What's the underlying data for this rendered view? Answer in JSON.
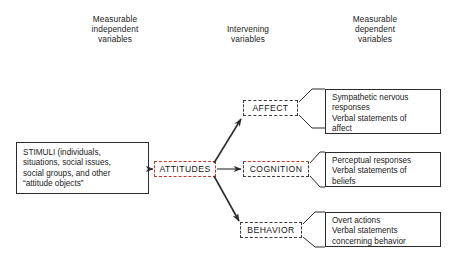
{
  "figure": {
    "type": "flow-diagram",
    "columns": [
      {
        "id": "independent",
        "label": "Measurable\nindependent\nvariables"
      },
      {
        "id": "intervening",
        "label": "Intervening\nvariables"
      },
      {
        "id": "dependent",
        "label": "Measurable\ndependent\nvariables"
      }
    ],
    "stimuli": {
      "label": "STIMULI  (individuals,\nsituations, social issues,\nsocial groups, and other\n“attitude objects”"
    },
    "attitudes": {
      "label": "ATTITUDES"
    },
    "components": [
      {
        "id": "affect",
        "label": "AFFECT"
      },
      {
        "id": "cognition",
        "label": "COGNITION"
      },
      {
        "id": "behavior",
        "label": "BEHAVIOR"
      }
    ],
    "outcomes": [
      {
        "id": "affect-outcomes",
        "label": "Sympathetic nervous\nresponses\nVerbal statements of\naffect"
      },
      {
        "id": "cognition-outcomes",
        "label": "Perceptual responses\nVerbal statements of\nbeliefs"
      },
      {
        "id": "behavior-outcomes",
        "label": "Overt actions\nVerbal statements\nconcerning behavior"
      }
    ],
    "colors": {
      "line": "#2b2b2b",
      "accent_dashed": "#c0392b",
      "neutral_dashed": "#3a3a3a",
      "background": "#ffffff",
      "text": "#1a1a1a"
    }
  }
}
